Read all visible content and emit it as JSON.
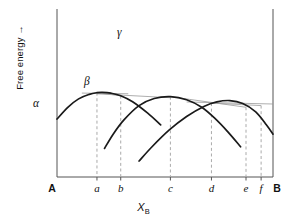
{
  "axes": {
    "ylabel": "Free energy",
    "ylabel_arrow": "→",
    "xlabel_main": "X",
    "xlabel_sub": "B",
    "x_start_label": "A",
    "x_end_label": "B",
    "tick_labels": [
      "a",
      "b",
      "c",
      "d",
      "e",
      "f"
    ],
    "frame_color": "#555555",
    "curve_color": "#1a1a1a",
    "tangent_color": "#999999",
    "dashed_color": "#aaaaaa"
  },
  "curves": [
    {
      "label": "α",
      "name": "alpha"
    },
    {
      "label": "β",
      "name": "beta"
    },
    {
      "label": "γ",
      "name": "gamma"
    }
  ],
  "chart_data": {
    "type": "line",
    "title": "",
    "xlabel": "X_B",
    "ylabel": "Free energy",
    "xlim": [
      0,
      1
    ],
    "ylim": [
      0,
      1
    ],
    "grid": false,
    "legend": "inline-curve-labels",
    "x_categories": [
      "A",
      "a",
      "b",
      "c",
      "d",
      "e",
      "f",
      "B"
    ],
    "x_positions": [
      0.0,
      0.185,
      0.295,
      0.525,
      0.715,
      0.875,
      0.945,
      1.0
    ],
    "series": [
      {
        "name": "α",
        "description": "alpha free-energy curve, minimum near x=0.21",
        "x": [
          0.0,
          0.05,
          0.1,
          0.15,
          0.185,
          0.21,
          0.25,
          0.295,
          0.35,
          0.42,
          0.48
        ],
        "y": [
          0.655,
          0.585,
          0.535,
          0.508,
          0.498,
          0.496,
          0.501,
          0.516,
          0.552,
          0.62,
          0.69
        ]
      },
      {
        "name": "β",
        "description": "beta free-energy curve, minimum near x=0.525",
        "x": [
          0.22,
          0.26,
          0.31,
          0.38,
          0.45,
          0.525,
          0.6,
          0.67,
          0.73,
          0.79,
          0.85
        ],
        "y": [
          0.83,
          0.745,
          0.66,
          0.575,
          0.533,
          0.522,
          0.54,
          0.585,
          0.65,
          0.73,
          0.82
        ]
      },
      {
        "name": "γ",
        "description": "gamma free-energy curve, minimum near x=0.80",
        "x": [
          0.38,
          0.44,
          0.52,
          0.6,
          0.68,
          0.74,
          0.8,
          0.86,
          0.92,
          0.97,
          1.0
        ],
        "y": [
          0.905,
          0.82,
          0.72,
          0.64,
          0.58,
          0.553,
          0.545,
          0.562,
          0.612,
          0.69,
          0.745
        ]
      }
    ],
    "tangents": [
      {
        "name": "alpha-beta-common-tangent",
        "from": [
          0.185,
          0.498
        ],
        "to": [
          0.295,
          0.516
        ],
        "note": "common tangent a-b"
      },
      {
        "name": "alpha-beta-lower-tangent",
        "from": [
          0.185,
          0.505
        ],
        "to": [
          0.525,
          0.528
        ],
        "note": "tangent a to beta minimum"
      },
      {
        "name": "beta-gamma-common-tangent",
        "from": [
          0.525,
          0.522
        ],
        "to": [
          0.875,
          0.585
        ],
        "note": "common tangent c-e region"
      },
      {
        "name": "gamma-right-tangent",
        "from": [
          0.715,
          0.56
        ],
        "to": [
          0.945,
          0.575
        ],
        "note": "tangent d-f"
      }
    ],
    "drop_lines": [
      {
        "label": "a",
        "x": 0.185
      },
      {
        "label": "b",
        "x": 0.295
      },
      {
        "label": "c",
        "x": 0.525
      },
      {
        "label": "d",
        "x": 0.715
      },
      {
        "label": "e",
        "x": 0.875
      },
      {
        "label": "f",
        "x": 0.945
      }
    ]
  }
}
